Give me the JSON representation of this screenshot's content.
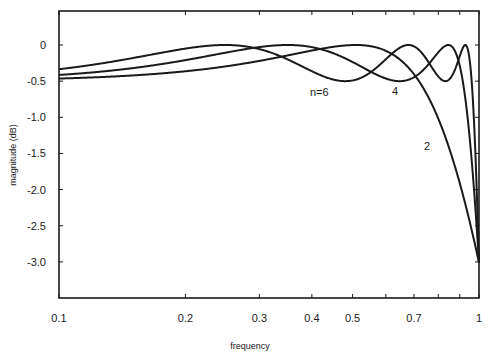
{
  "chart_data": {
    "type": "line",
    "title": "",
    "xlabel": "frequency",
    "ylabel": "magnitude (dB)",
    "xscale": "log",
    "xlim": [
      0.1,
      1.0
    ],
    "ylim": [
      -3.5,
      0.47
    ],
    "grid": false,
    "legend": "inline labels on curves",
    "x_ticks": [
      0.1,
      0.2,
      0.3,
      0.4,
      0.5,
      0.6,
      0.7,
      0.8,
      0.9,
      1.0
    ],
    "x_tick_labels": [
      "0.1",
      "0.2",
      "0.3",
      "0.4",
      "0.5",
      "",
      "0.7",
      "",
      "",
      "1"
    ],
    "y_ticks": [
      0,
      -0.5,
      -1.0,
      -1.5,
      -2.0,
      -2.5,
      -3.0
    ],
    "y_tick_labels": [
      "0",
      "-0.5",
      "-1.0",
      "-1.5",
      "-2.0",
      "-2.5",
      "-3.0"
    ],
    "x": [
      0.1,
      0.2,
      0.3,
      0.4,
      0.5,
      0.6,
      0.7,
      0.8,
      0.9,
      1.0
    ],
    "series": [
      {
        "name": "2",
        "values": [
          -0.45,
          -0.38,
          -0.2,
          -0.05,
          0.0,
          -0.1,
          -0.5,
          -1.1,
          -2.0,
          -3.0
        ]
      },
      {
        "name": "4",
        "values": [
          -0.4,
          -0.15,
          -0.01,
          -0.05,
          -0.25,
          -0.48,
          -0.3,
          0.0,
          -0.4,
          -3.0
        ]
      },
      {
        "name": "n=6",
        "values": [
          -0.35,
          -0.05,
          -0.02,
          -0.3,
          -0.48,
          -0.2,
          0.0,
          -0.5,
          -0.15,
          -3.0
        ]
      }
    ],
    "ripple_db": 0.5,
    "annotations": [
      {
        "text": "n=6",
        "x": 0.46,
        "y": -0.65
      },
      {
        "text": "4",
        "x": 0.64,
        "y": -0.62
      },
      {
        "text": "2",
        "x": 0.75,
        "y": -1.35
      }
    ]
  },
  "labels": {
    "xlabel": "frequency",
    "ylabel": "magnitude (dB)",
    "curve_n6": "n=6",
    "curve_4": "4",
    "curve_2": "2"
  },
  "colors": {
    "line": "#1a1a1a",
    "background": "#ffffff"
  }
}
